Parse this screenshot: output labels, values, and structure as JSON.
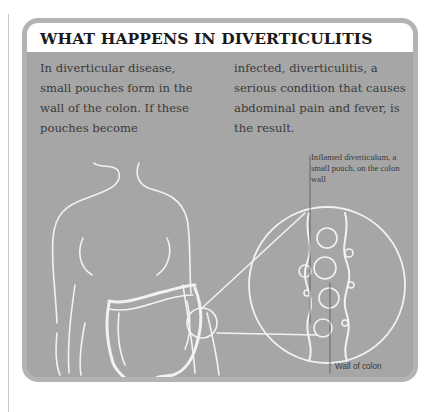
{
  "panel": {
    "title": "WHAT HAPPENS IN DIVERTICULITIS",
    "intro_col1": "In diverticular disease, small pouches form in the wall of the colon. If these pouches become",
    "intro_col2": "infected, diverticulitis, a serious condition that causes abdominal pain and fever, is the result."
  },
  "illustration": {
    "subject": "female torso outline with large intestine (colon) and magnified circular inset of colon wall",
    "labels": {
      "inflamed": "Inflamed diverticulum, a small pouch, on the colon wall",
      "wall": "Wall of colon"
    }
  },
  "colors": {
    "panel_bg": "#a6a6a6",
    "border": "#b3b3b3",
    "header_bg": "#ffffff",
    "line_art": "#f2f2f2",
    "text": "#3a3a3a"
  }
}
